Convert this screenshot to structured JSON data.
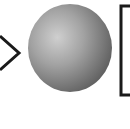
{
  "diagram": {
    "elements": [
      {
        "type": "chevron-arrow",
        "direction": "right",
        "stroke": "#1a1a1a"
      },
      {
        "type": "sphere",
        "fill_light": "#c8c8c8",
        "fill_dark": "#6a6a6a"
      },
      {
        "type": "rectangle",
        "stroke": "#1a1a1a",
        "partial": true
      }
    ]
  }
}
